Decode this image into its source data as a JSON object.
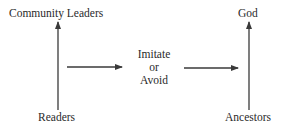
{
  "diagram": {
    "nodes": {
      "community_leaders": "Community Leaders",
      "readers": "Readers",
      "god": "God",
      "ancestors": "Ancestors",
      "middle_line1": "Imitate",
      "middle_line2": "or",
      "middle_line3": "Avoid"
    },
    "edges": [
      {
        "from": "Readers",
        "to": "Community Leaders",
        "direction": "up"
      },
      {
        "from": "Readers/Community Leaders",
        "to": "Imitate or Avoid",
        "direction": "right"
      },
      {
        "from": "Imitate or Avoid",
        "to": "God/Ancestors",
        "direction": "right"
      },
      {
        "from": "Ancestors",
        "to": "God",
        "direction": "up"
      }
    ],
    "colors": {
      "line": "#3a3a3a",
      "text": "#2a2a2a",
      "background": "#ffffff"
    }
  }
}
